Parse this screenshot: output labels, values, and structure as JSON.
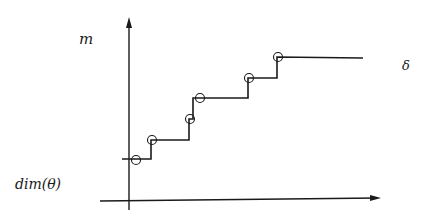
{
  "diagram": {
    "type": "step-function-plot",
    "y_axis_label": "m",
    "x_axis_label": "δ",
    "y_intercept_label": "dim(θ)",
    "colors": {
      "ink": "#1a1a1a",
      "background": "#ffffff"
    },
    "y_axis": {
      "x": 129,
      "y_top": 17,
      "y_bottom": 210
    },
    "x_axis": {
      "x_start": 100,
      "x_end": 381,
      "y_start": 201,
      "y_end": 198
    },
    "marked_points": [
      {
        "x": 136,
        "y": 160
      },
      {
        "x": 152,
        "y": 140
      },
      {
        "x": 190,
        "y": 119
      },
      {
        "x": 200,
        "y": 98
      },
      {
        "x": 249,
        "y": 78
      },
      {
        "x": 278,
        "y": 57
      }
    ],
    "step_path": [
      [
        122,
        159
      ],
      [
        151,
        159
      ],
      [
        151,
        140
      ],
      [
        189,
        140
      ],
      [
        189,
        119
      ],
      [
        193,
        119
      ],
      [
        193,
        98
      ],
      [
        248,
        98
      ],
      [
        248,
        78
      ],
      [
        277,
        78
      ],
      [
        277,
        57
      ],
      [
        363,
        58
      ]
    ]
  }
}
